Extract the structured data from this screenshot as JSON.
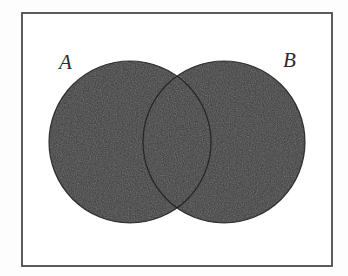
{
  "figure": {
    "kind": "venn-diagram",
    "canvas": {
      "width": 348,
      "height": 276
    },
    "background_color": "#fdfdfd",
    "frame": {
      "x": 21,
      "y": 12,
      "width": 312,
      "height": 255,
      "stroke_color": "#4a4a4a",
      "stroke_width": 2,
      "fill_color": "#ffffff"
    },
    "shading": {
      "description": "both circles fully shaded",
      "fill_color": "#3b3b3b",
      "outline_color": "#1c1c1c",
      "outline_width": 1.2
    },
    "sets": [
      {
        "id": "A",
        "label": "A",
        "label_x": 59,
        "label_y": 52,
        "circle": {
          "cx": 130,
          "cy": 142,
          "r": 81
        },
        "shaded": true
      },
      {
        "id": "B",
        "label": "B",
        "label_x": 283,
        "label_y": 50,
        "circle": {
          "cx": 224,
          "cy": 142,
          "r": 81
        },
        "shaded": true
      }
    ],
    "intersection": {
      "shaded": true,
      "top_vertex": {
        "x": 177,
        "y": 85
      },
      "bottom_vertex": {
        "x": 177,
        "y": 200
      }
    }
  }
}
